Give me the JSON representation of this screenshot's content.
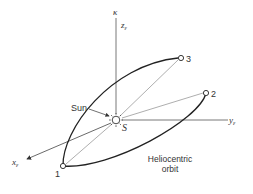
{
  "diagram": {
    "axes": {
      "z": {
        "label": "z",
        "subscript": "ε",
        "top_label": "κ"
      },
      "y": {
        "label": "y",
        "subscript": "ε"
      },
      "x": {
        "label": "x",
        "subscript": "ε"
      }
    },
    "sun": {
      "label": "Sun",
      "point_label": "S"
    },
    "points": [
      {
        "id": "1",
        "label": "1"
      },
      {
        "id": "2",
        "label": "2"
      },
      {
        "id": "3",
        "label": "3"
      }
    ],
    "orbit_caption": {
      "line1": "Heliocentric",
      "line2": "orbit"
    },
    "colors": {
      "line": "#333333",
      "thin": "#666666",
      "background": "#ffffff"
    }
  }
}
